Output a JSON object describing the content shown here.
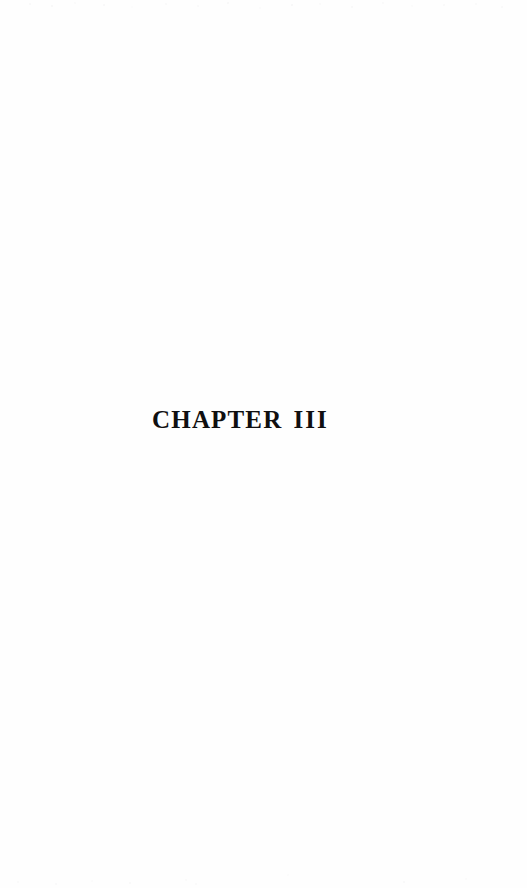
{
  "page": {
    "kind": "scanned-book-page",
    "background_color": "#fefefe",
    "ink_color": "#100f10",
    "width": 527,
    "height": 888
  },
  "heading": {
    "word": "CHAPTER",
    "numeral": "III",
    "full_text": "CHAPTER III"
  },
  "artifacts": {
    "top_edge_speckle": true,
    "bottom_edge_speckle": true
  }
}
